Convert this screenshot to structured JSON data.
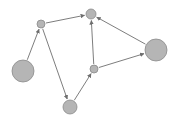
{
  "diagram": {
    "type": "directed-graph",
    "colors": {
      "node_fill": "#b5b5b5",
      "node_stroke": "#8a8a8a",
      "edge": "#6e6e6e"
    },
    "nodes": [
      {
        "id": "A",
        "x": 41,
        "y": 24,
        "r": 4
      },
      {
        "id": "B",
        "x": 91,
        "y": 14,
        "r": 5
      },
      {
        "id": "C",
        "x": 23,
        "y": 71,
        "r": 11
      },
      {
        "id": "D",
        "x": 156,
        "y": 50,
        "r": 11
      },
      {
        "id": "E",
        "x": 94,
        "y": 69,
        "r": 4
      },
      {
        "id": "F",
        "x": 70,
        "y": 107,
        "r": 7
      }
    ],
    "edges": [
      {
        "from": "C",
        "to": "A"
      },
      {
        "from": "A",
        "to": "B"
      },
      {
        "from": "A",
        "to": "F"
      },
      {
        "from": "F",
        "to": "E"
      },
      {
        "from": "E",
        "to": "B"
      },
      {
        "from": "E",
        "to": "D"
      },
      {
        "from": "D",
        "to": "B"
      }
    ]
  }
}
